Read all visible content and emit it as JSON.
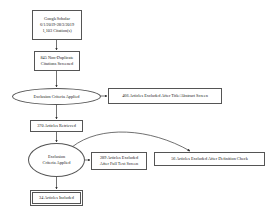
{
  "diagram": {
    "type": "flowchart",
    "nodes": [
      {
        "id": "source",
        "shape": "box",
        "lines": [
          "GoogleScholar",
          "6/1/2019-28/3/2019",
          "1,103 Citation(s)"
        ]
      },
      {
        "id": "dedup",
        "shape": "box",
        "lines": [
          "845 Non-Duplicate",
          "Citations Screened"
        ]
      },
      {
        "id": "criteria1",
        "shape": "ellipse",
        "lines": [
          "Exclusion Criteria Applied"
        ]
      },
      {
        "id": "excluded_title",
        "shape": "box",
        "lines": [
          "466 Articles Excluded After Title/Abstract Screen"
        ]
      },
      {
        "id": "retrieved",
        "shape": "box",
        "lines": [
          "370 Articles Retrieved"
        ]
      },
      {
        "id": "criteria2",
        "shape": "ellipse",
        "lines": [
          "Exclusion",
          "Criteria Applied"
        ]
      },
      {
        "id": "excluded_fulltext",
        "shape": "box",
        "lines": [
          "289 Articles Excluded",
          "After Full Text Screen"
        ]
      },
      {
        "id": "excluded_definition",
        "shape": "box",
        "lines": [
          "56 Articles Excluded After Definition Check"
        ]
      },
      {
        "id": "included",
        "shape": "double-box",
        "lines": [
          "34 Articles Included"
        ]
      }
    ],
    "edges": [
      {
        "from": "source",
        "to": "dedup"
      },
      {
        "from": "dedup",
        "to": "criteria1"
      },
      {
        "from": "criteria1",
        "to": "excluded_title"
      },
      {
        "from": "criteria1",
        "to": "retrieved"
      },
      {
        "from": "retrieved",
        "to": "criteria2"
      },
      {
        "from": "criteria2",
        "to": "excluded_fulltext"
      },
      {
        "from": "criteria2",
        "to": "excluded_definition"
      },
      {
        "from": "criteria2",
        "to": "included"
      }
    ]
  }
}
